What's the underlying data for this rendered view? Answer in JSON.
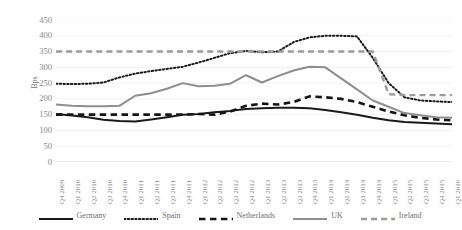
{
  "chart_data": {
    "type": "line",
    "title": "",
    "xlabel": "",
    "ylabel": "Bps",
    "ylim": [
      0,
      450
    ],
    "ytick_step": 50,
    "yticks": [
      "450",
      "400",
      "350",
      "300",
      "250",
      "200",
      "150",
      "100",
      "50",
      "0"
    ],
    "grid": true,
    "legend_position": "bottom",
    "categories": [
      "Q4 2009",
      "Q1 2010",
      "Q2 2010",
      "Q3 2010",
      "Q4 2010",
      "Q1 2011",
      "Q2 2011",
      "Q3 2011",
      "Q4 2011",
      "Q1 2012",
      "Q2 2012",
      "Q3 2012",
      "Q4 2012",
      "Q1 2013",
      "Q2 2013",
      "Q3 2013",
      "Q4 2013",
      "Q1 2014",
      "Q2 2014",
      "Q3 2014",
      "Q4 2014",
      "Q1 2015",
      "Q2 2015",
      "Q3 2015",
      "Q4 2015",
      "Q1 2016"
    ],
    "series": [
      {
        "name": "Germany",
        "style": "solid",
        "color": "#1a1a1a",
        "width": 2.0,
        "values": [
          152,
          147,
          142,
          134,
          130,
          128,
          135,
          142,
          150,
          152,
          158,
          162,
          168,
          170,
          172,
          172,
          170,
          165,
          158,
          150,
          140,
          132,
          127,
          124,
          122,
          120
        ]
      },
      {
        "name": "Spain",
        "style": "dotted",
        "color": "#1a1a1a",
        "width": 2.0,
        "values": [
          248,
          247,
          248,
          252,
          268,
          280,
          288,
          295,
          302,
          315,
          330,
          345,
          352,
          348,
          350,
          380,
          395,
          400,
          400,
          398,
          330,
          250,
          205,
          195,
          192,
          190
        ]
      },
      {
        "name": "Netherlands",
        "style": "dashed",
        "color": "#141414",
        "width": 2.6,
        "values": [
          150,
          150,
          150,
          150,
          150,
          150,
          150,
          150,
          150,
          152,
          150,
          160,
          178,
          185,
          182,
          190,
          208,
          205,
          200,
          190,
          175,
          160,
          148,
          140,
          135,
          132
        ]
      },
      {
        "name": "UK",
        "style": "solid",
        "color": "#8e8e8e",
        "width": 2.0,
        "values": [
          182,
          178,
          177,
          177,
          178,
          210,
          218,
          232,
          250,
          240,
          242,
          248,
          275,
          252,
          272,
          290,
          302,
          300,
          265,
          230,
          195,
          175,
          155,
          148,
          142,
          140
        ]
      },
      {
        "name": "Ireland",
        "style": "dashed",
        "color": "#9b9b9b",
        "width": 2.4,
        "values": [
          350,
          350,
          350,
          350,
          350,
          350,
          350,
          350,
          350,
          350,
          350,
          350,
          350,
          350,
          350,
          350,
          350,
          350,
          350,
          350,
          350,
          215,
          212,
          212,
          212,
          212
        ]
      }
    ]
  },
  "legend": {
    "items": [
      {
        "label": "Germany"
      },
      {
        "label": "Spain"
      },
      {
        "label": "Netherlands"
      },
      {
        "label": "UK"
      },
      {
        "label": "Ireland"
      }
    ]
  }
}
